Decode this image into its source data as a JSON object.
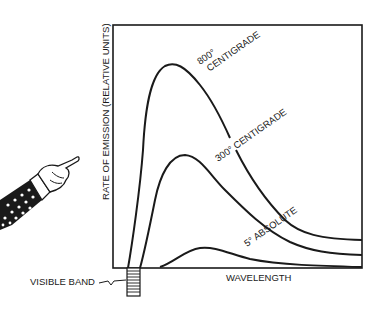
{
  "diagram": {
    "y_axis_label": "RATE OF EMISSION (RELATIVE UNITS)",
    "x_axis_label": "WAVELENGTH",
    "visible_band_label": "VISIBLE BAND",
    "curves": [
      {
        "id": "800c",
        "label_line1": "800°",
        "label_line2": "CENTIGRADE"
      },
      {
        "id": "300c",
        "label": "300° CENTIGRADE"
      },
      {
        "id": "5k",
        "label": "5° ABSOLUTE"
      }
    ],
    "illustration": "pointing-hand-icon"
  }
}
